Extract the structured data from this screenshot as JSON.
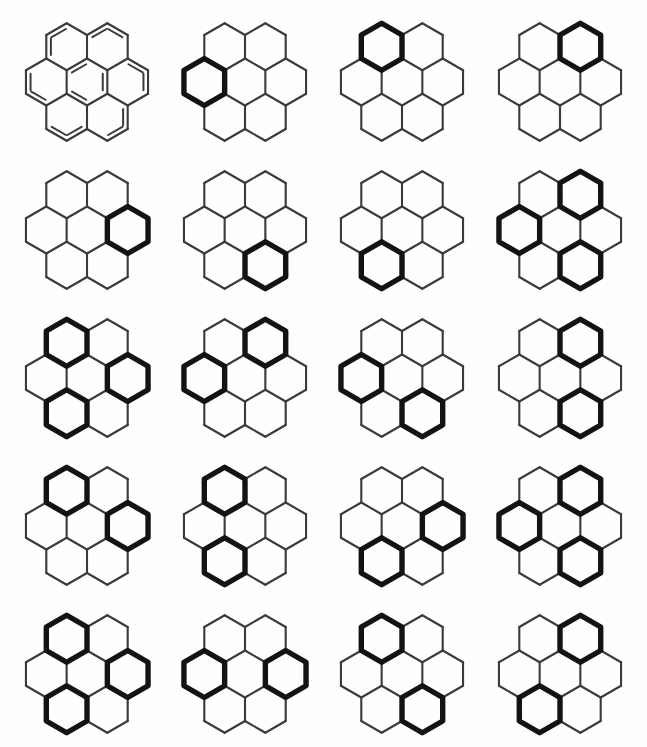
{
  "figure": {
    "caption": "",
    "panel_count": 20,
    "columns": 4,
    "rows": 5,
    "background_color": "#fefefe",
    "thin_stroke_color": "#3a3a3c",
    "bold_stroke_color": "#131314"
  },
  "legend": {
    "ring_positions": [
      "center",
      "top-left",
      "top-right",
      "right",
      "bottom-right",
      "bottom-left",
      "left"
    ],
    "bold_meaning": "aromatic sextet ring",
    "thin_meaning": "plain carbon skeleton bond"
  },
  "panels": [
    {
      "index": 1,
      "label": "",
      "style": "kekule",
      "bold_rings": [],
      "double_bond_ring_indices": [
        0,
        1,
        2,
        3,
        4,
        5,
        6
      ],
      "description": "coronene with Kekule double bonds"
    },
    {
      "index": 2,
      "label": "",
      "style": "clar",
      "bold_rings": [
        6
      ],
      "description": "left ring bold"
    },
    {
      "index": 3,
      "label": "",
      "style": "clar",
      "bold_rings": [
        1
      ],
      "description": "top-left ring bold"
    },
    {
      "index": 4,
      "label": "",
      "style": "clar",
      "bold_rings": [
        2
      ],
      "description": "top-right ring bold"
    },
    {
      "index": 5,
      "label": "",
      "style": "clar",
      "bold_rings": [
        3
      ],
      "description": "right ring bold"
    },
    {
      "index": 6,
      "label": "",
      "style": "clar",
      "bold_rings": [
        4
      ],
      "description": "bottom-right ring bold"
    },
    {
      "index": 7,
      "label": "",
      "style": "clar",
      "bold_rings": [
        5
      ],
      "description": "bottom-left ring bold"
    },
    {
      "index": 8,
      "label": "",
      "style": "clar",
      "bold_rings": [
        2,
        6,
        4
      ],
      "description": "top-right, left and bottom-right rings bold"
    },
    {
      "index": 9,
      "label": "",
      "style": "clar",
      "bold_rings": [
        1,
        3,
        5
      ],
      "description": "top-left, right and bottom-left rings bold"
    },
    {
      "index": 10,
      "label": "",
      "style": "clar",
      "bold_rings": [
        2,
        6
      ],
      "description": "top-right and left rings bold"
    },
    {
      "index": 11,
      "label": "",
      "style": "clar",
      "bold_rings": [
        6,
        4
      ],
      "description": "left and bottom-right rings bold"
    },
    {
      "index": 12,
      "label": "",
      "style": "clar",
      "bold_rings": [
        2,
        4
      ],
      "description": "top-right and bottom-right rings bold"
    },
    {
      "index": 13,
      "label": "",
      "style": "clar",
      "bold_rings": [
        1,
        3
      ],
      "description": "top-left and right rings bold"
    },
    {
      "index": 14,
      "label": "",
      "style": "clar",
      "bold_rings": [
        1,
        5
      ],
      "description": "top-left and bottom-left rings bold"
    },
    {
      "index": 15,
      "label": "",
      "style": "clar",
      "bold_rings": [
        3,
        5
      ],
      "description": "right and bottom-left rings bold"
    },
    {
      "index": 16,
      "label": "",
      "style": "clar",
      "bold_rings": [
        2,
        6,
        4
      ],
      "description": "top-right, left and bottom-right rings bold"
    },
    {
      "index": 17,
      "label": "",
      "style": "clar",
      "bold_rings": [
        1,
        3,
        5
      ],
      "description": "top-left, right and bottom-left rings bold"
    },
    {
      "index": 18,
      "label": "",
      "style": "clar",
      "bold_rings": [
        6,
        3
      ],
      "description": "left and right rings bold"
    },
    {
      "index": 19,
      "label": "",
      "style": "clar",
      "bold_rings": [
        1,
        4
      ],
      "description": "top-left and bottom-right rings bold"
    },
    {
      "index": 20,
      "label": "",
      "style": "clar",
      "bold_rings": [
        2,
        5
      ],
      "description": "top-right and bottom-left rings bold"
    }
  ]
}
